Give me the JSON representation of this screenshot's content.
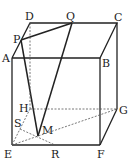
{
  "figure": {
    "type": "rectangular-prism",
    "labels": {
      "A": "A",
      "B": "B",
      "C": "C",
      "D": "D",
      "E": "E",
      "F": "F",
      "G": "G",
      "H": "H",
      "P": "P",
      "Q": "Q",
      "R": "R",
      "S": "S",
      "M": "M"
    },
    "colors": {
      "line": "#222222",
      "hidden": "#555555",
      "background": "#ffffff"
    }
  }
}
